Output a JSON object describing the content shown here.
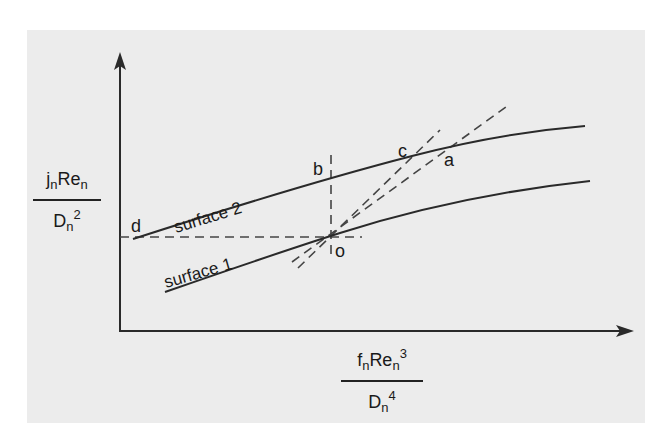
{
  "diagram": {
    "y_axis_label": {
      "numerator": {
        "a": "j",
        "a_sub": "n",
        "b": "Re",
        "b_sub": "n"
      },
      "denominator": {
        "a": "D",
        "a_sub": "n",
        "a_sup": "2"
      }
    },
    "x_axis_label": {
      "numerator": {
        "a": "f",
        "a_sub": "n",
        "b": "Re",
        "b_sub": "n",
        "b_sup": "3"
      },
      "denominator": {
        "a": "D",
        "a_sub": "n",
        "a_sup": "4"
      }
    },
    "curves": [
      {
        "name": "surface 2",
        "label": "surface 2"
      },
      {
        "name": "surface 1",
        "label": "surface 1"
      }
    ],
    "points": {
      "a": "a",
      "b": "b",
      "c": "c",
      "d": "d",
      "o": "o"
    },
    "colors": {
      "background": "#ececec",
      "line": "#2a2a2a",
      "dashed": "#444444"
    }
  }
}
